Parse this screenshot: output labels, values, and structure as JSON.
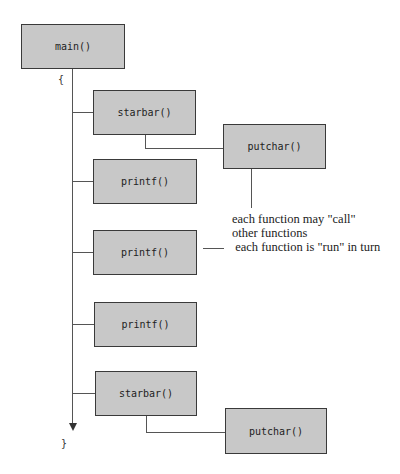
{
  "diagram": {
    "root": {
      "label": "main()",
      "open_brace": "{",
      "close_brace": "}"
    },
    "calls": [
      {
        "label": "starbar()",
        "subcall": "putchar()"
      },
      {
        "label": "printf()"
      },
      {
        "label": "printf()"
      },
      {
        "label": "printf()"
      },
      {
        "label": "starbar()",
        "subcall": "putchar()"
      }
    ],
    "annotations": [
      "each function may \"call\"",
      "other functions",
      " each function is \"run\" in turn"
    ]
  }
}
